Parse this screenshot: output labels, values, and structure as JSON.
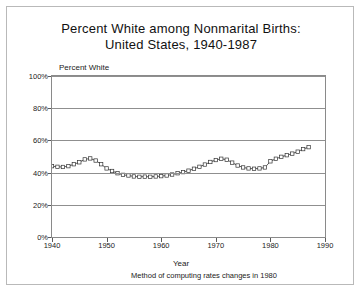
{
  "title": {
    "line1": "Percent White among Nonmarital Births:",
    "line2": "United States, 1940-1987"
  },
  "axis": {
    "y_title": "Percent White",
    "x_title": "Year",
    "footnote": "Method of computing rates changes in 1980"
  },
  "chart_data": {
    "type": "line",
    "title": "Percent White among Nonmarital Births: United States, 1940-1987",
    "subtitle": "",
    "xlabel": "Year",
    "ylabel": "Percent White",
    "xlim": [
      1940,
      1990
    ],
    "ylim": [
      0,
      100
    ],
    "xticks": [
      1940,
      1950,
      1960,
      1970,
      1980,
      1990
    ],
    "xticklabels": [
      "1940",
      "1950",
      "1960",
      "1970",
      "1980",
      "1990"
    ],
    "yticks": [
      0,
      20,
      40,
      60,
      80,
      100
    ],
    "yticklabels": [
      "0%",
      "20%",
      "40%",
      "60%",
      "80%",
      "100%"
    ],
    "grid": "horizontal",
    "legend": "none",
    "marker": "open-square",
    "annotations": [
      "Method of computing rates changes in 1980"
    ],
    "series": [
      {
        "name": "Percent White",
        "x": [
          1940,
          1941,
          1942,
          1943,
          1944,
          1945,
          1946,
          1947,
          1948,
          1949,
          1950,
          1951,
          1952,
          1953,
          1954,
          1955,
          1956,
          1957,
          1958,
          1959,
          1960,
          1961,
          1962,
          1963,
          1964,
          1965,
          1966,
          1967,
          1968,
          1969,
          1970,
          1971,
          1972,
          1973,
          1974,
          1975,
          1976,
          1977,
          1978,
          1979,
          1980,
          1981,
          1982,
          1983,
          1984,
          1985,
          1986,
          1987
        ],
        "values": [
          44.0,
          43.6,
          43.5,
          44.0,
          45.2,
          46.4,
          48.2,
          48.8,
          47.5,
          45.2,
          42.6,
          41.0,
          39.6,
          38.6,
          38.2,
          37.6,
          37.4,
          37.5,
          37.4,
          37.6,
          37.8,
          38.2,
          38.8,
          39.6,
          40.3,
          41.2,
          42.4,
          43.6,
          45.0,
          46.6,
          47.8,
          48.6,
          48.0,
          46.2,
          44.4,
          43.2,
          42.6,
          42.4,
          42.6,
          43.2,
          47.0,
          48.6,
          49.8,
          50.8,
          51.8,
          53.0,
          54.6,
          55.8
        ]
      }
    ]
  }
}
